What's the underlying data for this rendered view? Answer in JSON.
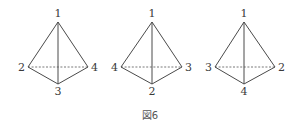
{
  "figure": {
    "caption": "図6",
    "tetrahedra": [
      {
        "apex": {
          "label": "1",
          "x": 58,
          "y": 22
        },
        "left": {
          "label": "2",
          "x": 28,
          "y": 67
        },
        "right": {
          "label": "4",
          "x": 88,
          "y": 67
        },
        "bottom": {
          "label": "3",
          "x": 58,
          "y": 84
        }
      },
      {
        "apex": {
          "label": "1",
          "x": 152,
          "y": 22
        },
        "left": {
          "label": "4",
          "x": 121,
          "y": 67
        },
        "right": {
          "label": "3",
          "x": 182,
          "y": 67
        },
        "bottom": {
          "label": "2",
          "x": 152,
          "y": 84
        }
      },
      {
        "apex": {
          "label": "1",
          "x": 244,
          "y": 22
        },
        "left": {
          "label": "3",
          "x": 215,
          "y": 67
        },
        "right": {
          "label": "2",
          "x": 275,
          "y": 67
        },
        "bottom": {
          "label": "4",
          "x": 244,
          "y": 84
        }
      }
    ]
  }
}
